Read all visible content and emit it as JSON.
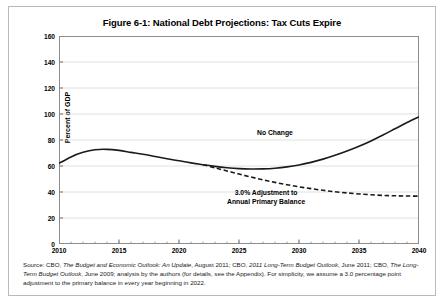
{
  "figure": {
    "title": "Figure 6-1: National Debt Projections: Tax Cuts Expire",
    "source_line1_prefix": "Source: CBO, ",
    "source_italic1": "The Budget and Economic Outlook: An Update",
    "source_mid1": ", August 2011; CBO, ",
    "source_italic2": "2011 Long-Term Budget Outlook",
    "source_mid2": ",",
    "source_line2_prefix": "June 2011; CBO, ",
    "source_italic3": "The Long-Term Budget Outlook",
    "source_mid3": ", June 2009; analysis by the authors (for details, see the Appendix).",
    "source_line3": "For simplicity, we assume a 3.0 percentage point adjustment to the primary balance in every year beginning in 2022."
  },
  "chart_data": {
    "type": "line",
    "title": "Figure 6-1: National Debt Projections: Tax Cuts Expire",
    "xlabel": "",
    "ylabel": "Percent of GDP",
    "xlim": [
      2010,
      2040
    ],
    "ylim": [
      0,
      160
    ],
    "ytick_step": 20,
    "yticks": [
      0,
      20,
      40,
      60,
      80,
      100,
      120,
      140,
      160
    ],
    "xticks": [
      2010,
      2015,
      2020,
      2025,
      2030,
      2035,
      2040
    ],
    "x_minor_tick_step": 1,
    "grid": "horizontal",
    "legend_position": "inline-annotation",
    "line_color": "#1a1a1a",
    "gridline_color": "#d8d8d8",
    "x": [
      2010,
      2011,
      2012,
      2013,
      2014,
      2015,
      2016,
      2017,
      2018,
      2019,
      2020,
      2021,
      2022,
      2023,
      2024,
      2025,
      2026,
      2027,
      2028,
      2029,
      2030,
      2031,
      2032,
      2033,
      2034,
      2035,
      2036,
      2037,
      2038,
      2039,
      2040
    ],
    "series": [
      {
        "name": "No Change",
        "style": "solid",
        "values": [
          62,
          67,
          70.5,
          72.5,
          72.8,
          72,
          70.5,
          69,
          67.3,
          65.6,
          64,
          62.4,
          61,
          59.7,
          58.7,
          58,
          57.7,
          57.8,
          58.3,
          59.3,
          60.8,
          62.8,
          65.3,
          68.2,
          71.5,
          75.2,
          79.3,
          83.8,
          88.6,
          93.4,
          97.8
        ]
      },
      {
        "name": "3.0% Adjustment to Annual Primary Balance",
        "style": "dashed",
        "branch_year": 2022,
        "values": [
          null,
          null,
          null,
          null,
          null,
          null,
          null,
          null,
          null,
          null,
          null,
          null,
          61,
          58.6,
          56.2,
          53.8,
          51.5,
          49.4,
          47.4,
          45.6,
          44,
          42.6,
          41.3,
          40.2,
          39.3,
          38.5,
          37.9,
          37.4,
          37.1,
          36.9,
          36.8
        ]
      }
    ],
    "annotations": [
      {
        "text": "No Change",
        "x": 2028,
        "y": 85
      },
      {
        "text_line1": "3.0% Adjustment to",
        "text_line2": "Annual Primary Balance",
        "x": 2026,
        "y": 40
      }
    ]
  }
}
